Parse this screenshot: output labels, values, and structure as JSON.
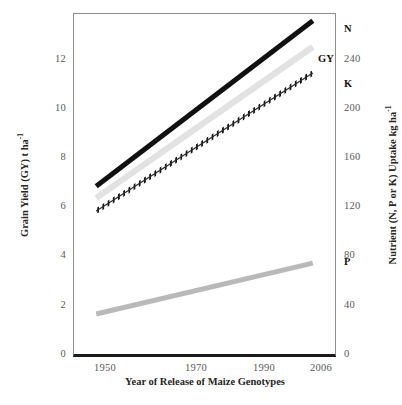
{
  "chart_data": {
    "type": "line",
    "title": "",
    "xlabel": "Year of Release of Maize Genotypes",
    "ylabel": "Grain Yield (GY) t ha-1",
    "ylabel_html": "Grain Yield (GY) t ha",
    "ylabel_sup": "-1",
    "y2label_html": "Nutrient (N, P or K) Uptake kg ha",
    "y2label_sup": "-1",
    "y2label": "Nutrient (N, P or K) Uptake kg ha-1",
    "grid": false,
    "legend_position": "line-end-labels",
    "x": [
      1950,
      1970,
      1990,
      2006
    ],
    "xlim": [
      1944,
      2012
    ],
    "xticks": [
      "1950",
      "1970",
      "1990",
      "2006"
    ],
    "xtick_values": [
      1950,
      1970,
      1990,
      2006
    ],
    "ylim": [
      0,
      13.2
    ],
    "yticks": [
      "0",
      "2",
      "4",
      "6",
      "8",
      "10",
      "12"
    ],
    "ytick_values": [
      0,
      2,
      4,
      6,
      8,
      10,
      12
    ],
    "y2lim": [
      0,
      264
    ],
    "y2ticks": [
      "0",
      "40",
      "80",
      "120",
      "160",
      "200",
      "240"
    ],
    "y2tick_values": [
      0,
      40,
      80,
      120,
      160,
      200,
      240
    ],
    "series": [
      {
        "name": "N",
        "label": "N",
        "axis": "right",
        "units": "kg ha-1",
        "style": "solid-thick",
        "color": "#111111",
        "x": [
          1950,
          2006
        ],
        "values": [
          131,
          258
        ]
      },
      {
        "name": "GY",
        "label": "GY",
        "axis": "left",
        "units": "t ha-1",
        "style": "solid-thick",
        "color": "#e2e2e2",
        "x": [
          1950,
          2006
        ],
        "values": [
          6.1,
          11.9
        ]
      },
      {
        "name": "K",
        "label": "K",
        "axis": "right",
        "units": "kg ha-1",
        "style": "beaded-dash",
        "color": "#141414",
        "x": [
          1950,
          2006
        ],
        "values": [
          112,
          218
        ]
      },
      {
        "name": "P",
        "label": "P",
        "axis": "right",
        "units": "kg ha-1",
        "style": "solid-thick",
        "color": "#b9b9b9",
        "x": [
          1950,
          2006
        ],
        "values": [
          33,
          72
        ]
      }
    ]
  },
  "axes": {
    "left": {
      "title_main": "Grain Yield (GY) t ha",
      "title_sup": "-1",
      "ticks": [
        "0",
        "2",
        "4",
        "6",
        "8",
        "10",
        "12"
      ]
    },
    "right": {
      "title_main": "Nutrient (N, P or K) Uptake kg ha",
      "title_sup": "-1",
      "ticks": [
        "0",
        "40",
        "80",
        "120",
        "160",
        "200",
        "240"
      ]
    },
    "bottom": {
      "title": "Year of Release of Maize Genotypes",
      "ticks": [
        "1950",
        "1970",
        "1990",
        "2006"
      ]
    }
  },
  "series_labels": {
    "n": "N",
    "gy": "GY",
    "k": "K",
    "p": "P"
  },
  "colors": {
    "n_line": "#111111",
    "gy_line": "#e2e2e2",
    "k_line": "#141414",
    "p_line": "#b9b9b9",
    "frame": "#8e8e8e",
    "baseline": "#1b1b1b",
    "tick_text": "#59595b",
    "title_text": "#262626",
    "background": "#ffffff"
  }
}
